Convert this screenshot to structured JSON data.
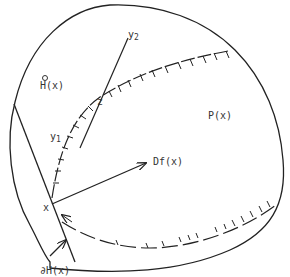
{
  "diagram": {
    "stroke_color": "#222222",
    "label_color": "#333333",
    "labels": {
      "y2": {
        "base": "y",
        "sub": "2"
      },
      "h_interior": "H(x)",
      "z": "z",
      "p": "P(x)",
      "y1": {
        "base": "y",
        "sub": "1"
      },
      "df": "Df(x)",
      "x": "x",
      "boundary_h": "∂H(x)"
    },
    "elements": [
      "outer region boundary",
      "half-space boundary line ∂H(x)",
      "hatched curve through x, y1, z",
      "line segment y1–y2 through z",
      "arrow Df(x) from x",
      "pointer arrow from ∂H(x) label"
    ]
  }
}
